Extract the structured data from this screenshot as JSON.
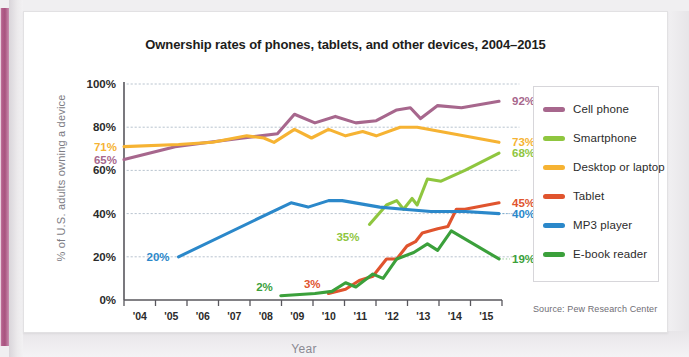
{
  "chart_data": {
    "type": "line",
    "title": "Ownership rates of phones, tablets, and other devices, 2004–2015",
    "xlabel": "Year",
    "ylabel": "% of U.S. adults owning a device",
    "source": "Source: Pew Research Center",
    "x": [
      "'04",
      "'05",
      "'06",
      "'07",
      "'08",
      "'09",
      "'10",
      "'11",
      "'12",
      "'13",
      "'14",
      "'15"
    ],
    "xlim": [
      2004,
      2015
    ],
    "ylim": [
      0,
      100
    ],
    "yticks": [
      "0%",
      "20%",
      "40%",
      "60%",
      "80%",
      "100%"
    ],
    "ytick_values": [
      0,
      20,
      40,
      60,
      80,
      100
    ],
    "grid": "horizontal-dotted",
    "legend_position": "right",
    "series": [
      {
        "name": "Cell phone",
        "color": "#a7678d",
        "start_label": "65%",
        "end_label": "92%",
        "points": [
          {
            "x": 2004.0,
            "y": 65
          },
          {
            "x": 2005.5,
            "y": 71
          },
          {
            "x": 2006.5,
            "y": 73
          },
          {
            "x": 2007.5,
            "y": 75
          },
          {
            "x": 2008.5,
            "y": 77
          },
          {
            "x": 2009.0,
            "y": 86
          },
          {
            "x": 2009.6,
            "y": 82
          },
          {
            "x": 2010.2,
            "y": 85
          },
          {
            "x": 2010.8,
            "y": 82
          },
          {
            "x": 2011.4,
            "y": 83
          },
          {
            "x": 2012.0,
            "y": 88
          },
          {
            "x": 2012.4,
            "y": 89
          },
          {
            "x": 2012.7,
            "y": 84
          },
          {
            "x": 2013.2,
            "y": 90
          },
          {
            "x": 2013.9,
            "y": 89
          },
          {
            "x": 2015.0,
            "y": 92
          }
        ]
      },
      {
        "name": "Smartphone",
        "color": "#8fc63f",
        "mid_label": "35%",
        "end_label": "68%",
        "points": [
          {
            "x": 2011.2,
            "y": 35
          },
          {
            "x": 2011.7,
            "y": 44
          },
          {
            "x": 2012.0,
            "y": 46
          },
          {
            "x": 2012.2,
            "y": 42
          },
          {
            "x": 2012.45,
            "y": 47
          },
          {
            "x": 2012.6,
            "y": 44
          },
          {
            "x": 2012.9,
            "y": 56
          },
          {
            "x": 2013.3,
            "y": 55
          },
          {
            "x": 2014.0,
            "y": 60
          },
          {
            "x": 2015.0,
            "y": 68
          }
        ]
      },
      {
        "name": "Desktop or laptop",
        "color": "#f6b333",
        "start_label": "71%",
        "end_label": "73%",
        "points": [
          {
            "x": 2004.0,
            "y": 71
          },
          {
            "x": 2005.6,
            "y": 72
          },
          {
            "x": 2006.6,
            "y": 73
          },
          {
            "x": 2007.6,
            "y": 76
          },
          {
            "x": 2008.1,
            "y": 75
          },
          {
            "x": 2008.4,
            "y": 73
          },
          {
            "x": 2009.0,
            "y": 79
          },
          {
            "x": 2009.5,
            "y": 75
          },
          {
            "x": 2010.0,
            "y": 79
          },
          {
            "x": 2010.5,
            "y": 76
          },
          {
            "x": 2011.0,
            "y": 78
          },
          {
            "x": 2011.4,
            "y": 76
          },
          {
            "x": 2012.1,
            "y": 80
          },
          {
            "x": 2012.6,
            "y": 80
          },
          {
            "x": 2015.0,
            "y": 73
          }
        ]
      },
      {
        "name": "Tablet",
        "color": "#e0542e",
        "mid_label": "3%",
        "end_label": "45%",
        "points": [
          {
            "x": 2010.0,
            "y": 3
          },
          {
            "x": 2010.5,
            "y": 5
          },
          {
            "x": 2010.9,
            "y": 9
          },
          {
            "x": 2011.3,
            "y": 11
          },
          {
            "x": 2011.7,
            "y": 19
          },
          {
            "x": 2012.0,
            "y": 19
          },
          {
            "x": 2012.3,
            "y": 25
          },
          {
            "x": 2012.55,
            "y": 27
          },
          {
            "x": 2012.75,
            "y": 31
          },
          {
            "x": 2013.2,
            "y": 33
          },
          {
            "x": 2013.5,
            "y": 34
          },
          {
            "x": 2013.75,
            "y": 42
          },
          {
            "x": 2014.0,
            "y": 42
          },
          {
            "x": 2015.0,
            "y": 45
          }
        ]
      },
      {
        "name": "MP3 player",
        "color": "#2b88ca",
        "mid_label": "20%",
        "end_label": "40%",
        "points": [
          {
            "x": 2005.6,
            "y": 20
          },
          {
            "x": 2008.9,
            "y": 45
          },
          {
            "x": 2009.4,
            "y": 43
          },
          {
            "x": 2010.0,
            "y": 46
          },
          {
            "x": 2010.4,
            "y": 46
          },
          {
            "x": 2011.5,
            "y": 43
          },
          {
            "x": 2012.2,
            "y": 42
          },
          {
            "x": 2013.0,
            "y": 41
          },
          {
            "x": 2014.0,
            "y": 41
          },
          {
            "x": 2015.0,
            "y": 40
          }
        ]
      },
      {
        "name": "E-book reader",
        "color": "#3ba03b",
        "mid_label": "2%",
        "end_label": "19%",
        "points": [
          {
            "x": 2008.6,
            "y": 2
          },
          {
            "x": 2009.6,
            "y": 3
          },
          {
            "x": 2010.1,
            "y": 4
          },
          {
            "x": 2010.5,
            "y": 8
          },
          {
            "x": 2010.8,
            "y": 6
          },
          {
            "x": 2011.3,
            "y": 12
          },
          {
            "x": 2011.6,
            "y": 10
          },
          {
            "x": 2012.0,
            "y": 19
          },
          {
            "x": 2012.5,
            "y": 22
          },
          {
            "x": 2012.9,
            "y": 26
          },
          {
            "x": 2013.2,
            "y": 23
          },
          {
            "x": 2013.6,
            "y": 32
          },
          {
            "x": 2015.0,
            "y": 19
          }
        ]
      }
    ]
  }
}
